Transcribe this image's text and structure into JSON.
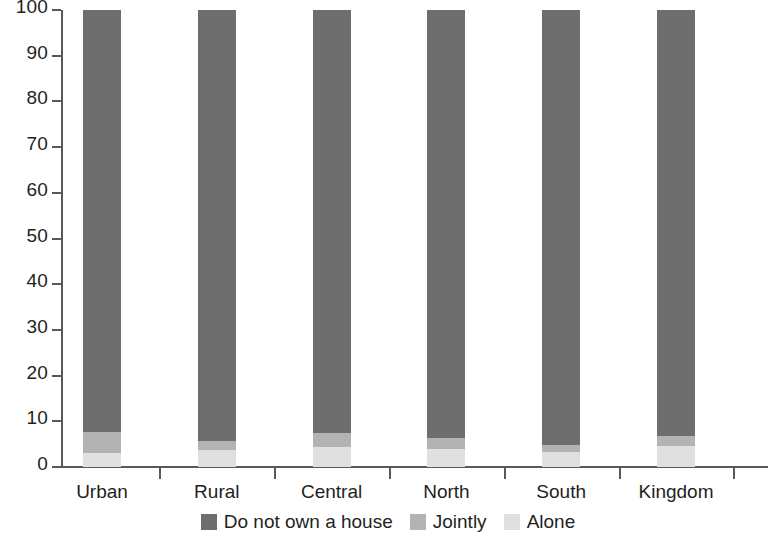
{
  "chart_data": {
    "type": "bar",
    "subtype": "stacked-bar-100",
    "title": "",
    "subtitle": "",
    "xlabel": "",
    "ylabel": "",
    "ylim": [
      0,
      100
    ],
    "ytick_labels": [
      "0",
      "10",
      "20",
      "30",
      "40",
      "50",
      "60",
      "70",
      "80",
      "90",
      "100"
    ],
    "yticks": [
      0,
      10,
      20,
      30,
      40,
      50,
      60,
      70,
      80,
      90,
      100
    ],
    "grid": false,
    "legend_position": "bottom",
    "categories": [
      "Urban",
      "Rural",
      "Central",
      "North",
      "South",
      "Kingdom"
    ],
    "series": [
      {
        "name": "Alone",
        "color": "#e0e0e0",
        "values": [
          3,
          3.7,
          4.4,
          4,
          3.3,
          4.6
        ]
      },
      {
        "name": "Jointly",
        "color": "#b3b3b3",
        "values": [
          4.6,
          2,
          3,
          2.3,
          1.5,
          2.2
        ]
      },
      {
        "name": "Do not own a house",
        "color": "#6e6e6e",
        "values": [
          92.4,
          94.3,
          92.6,
          93.7,
          95.2,
          93.2
        ]
      }
    ],
    "legend": [
      {
        "label": "Do not own a house",
        "color": "#6e6e6e"
      },
      {
        "label": "Jointly",
        "color": "#b3b3b3"
      },
      {
        "label": "Alone",
        "color": "#e0e0e0"
      }
    ]
  }
}
